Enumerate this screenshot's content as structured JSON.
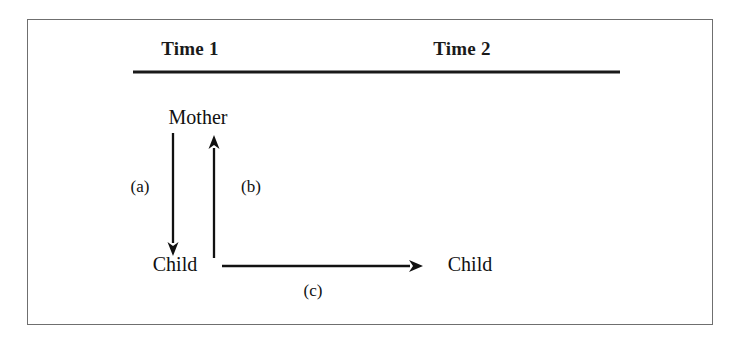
{
  "figure": {
    "type": "cross-lagged-panel-diagram",
    "headers": [
      {
        "label": "Time 1"
      },
      {
        "label": "Time 2"
      }
    ],
    "nodes": [
      {
        "id": "mother-t1",
        "label": "Mother",
        "time": "Time 1"
      },
      {
        "id": "child-t1",
        "label": "Child",
        "time": "Time 1"
      },
      {
        "id": "child-t2",
        "label": "Child",
        "time": "Time 2"
      }
    ],
    "paths": [
      {
        "id": "a",
        "label": "(a)",
        "from": "mother-t1",
        "to": "child-t1",
        "direction": "down"
      },
      {
        "id": "b",
        "label": "(b)",
        "from": "child-t1",
        "to": "mother-t1",
        "direction": "up"
      },
      {
        "id": "c",
        "label": "(c)",
        "from": "child-t1",
        "to": "child-t2",
        "direction": "right"
      }
    ],
    "colors": {
      "frame": "#6f6f6f",
      "rule": "#1a1a1a",
      "arrow": "#111111",
      "text": "#111111",
      "background": "#ffffff"
    }
  }
}
